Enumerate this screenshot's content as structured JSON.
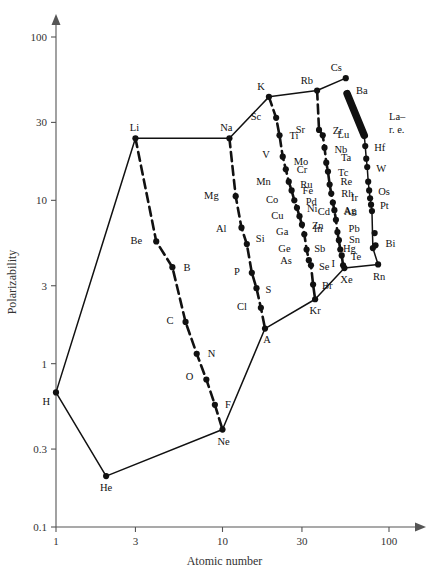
{
  "chart_data": {
    "type": "scatter",
    "title": "",
    "xlabel": "Atomic number",
    "ylabel": "Polarizability",
    "xscale": "log",
    "yscale": "log",
    "xlim": [
      1,
      120
    ],
    "ylim": [
      0.1,
      130
    ],
    "grid": false,
    "legend": null,
    "xticks": [
      "1",
      "3",
      "10",
      "30",
      "100"
    ],
    "xtick_values": [
      1,
      3,
      10,
      30,
      100
    ],
    "yticks": [
      "100",
      "30",
      "10",
      "3",
      "1",
      "0.3",
      "0.1"
    ],
    "ytick_values": [
      100,
      30,
      10,
      3,
      1,
      0.3,
      0.1
    ],
    "annotations": [
      {
        "text": "La–",
        "x": 100,
        "y": 31
      },
      {
        "text": "r. e.",
        "x": 100,
        "y": 26
      }
    ],
    "points": [
      {
        "label": "H",
        "z": 1,
        "v": 0.667,
        "lx": -6,
        "ly": 13
      },
      {
        "label": "He",
        "z": 2,
        "v": 0.205,
        "lx": 0,
        "ly": 15
      },
      {
        "label": "Li",
        "z": 3,
        "v": 24.0,
        "lx": -1,
        "ly": -7
      },
      {
        "label": "Be",
        "z": 4,
        "v": 5.6,
        "lx": -14,
        "ly": 3
      },
      {
        "label": "B",
        "z": 5,
        "v": 3.9,
        "lx": 11,
        "ly": 4
      },
      {
        "label": "C",
        "z": 6,
        "v": 1.8,
        "lx": -12,
        "ly": 2
      },
      {
        "label": "N",
        "z": 7,
        "v": 1.15,
        "lx": 11,
        "ly": 3
      },
      {
        "label": "O",
        "z": 8,
        "v": 0.8,
        "lx": -13,
        "ly": 1
      },
      {
        "label": "F",
        "z": 9,
        "v": 0.56,
        "lx": 10,
        "ly": 3
      },
      {
        "label": "Ne",
        "z": 10,
        "v": 0.395,
        "lx": 1,
        "ly": 15
      },
      {
        "label": "Na",
        "z": 11,
        "v": 24.0,
        "lx": -3,
        "ly": -7
      },
      {
        "label": "Mg",
        "z": 12,
        "v": 10.6,
        "lx": -17,
        "ly": 3
      },
      {
        "label": "Al",
        "z": 13,
        "v": 6.8,
        "lx": -15,
        "ly": 4
      },
      {
        "label": "Si",
        "z": 14,
        "v": 5.4,
        "lx": 9,
        "ly": -2
      },
      {
        "label": "P",
        "z": 15,
        "v": 3.6,
        "lx": -12,
        "ly": 2
      },
      {
        "label": "S",
        "z": 16,
        "v": 2.9,
        "lx": 9,
        "ly": 5
      },
      {
        "label": "Cl",
        "z": 17,
        "v": 2.2,
        "lx": -14,
        "ly": 2
      },
      {
        "label": "A",
        "z": 18,
        "v": 1.64,
        "lx": 2,
        "ly": 14
      },
      {
        "label": "K",
        "z": 19,
        "v": 43.0,
        "lx": -4,
        "ly": -7
      },
      {
        "label": "Sc",
        "z": 21,
        "v": 32.0,
        "lx": -15,
        "ly": 2
      },
      {
        "label": "Ti",
        "z": 22,
        "v": 25.0,
        "lx": 10,
        "ly": 4
      },
      {
        "label": "V",
        "z": 23,
        "v": 18.5,
        "lx": -13,
        "ly": 1
      },
      {
        "label": "Cr",
        "z": 24,
        "v": 15.5,
        "lx": 11,
        "ly": 4
      },
      {
        "label": "Mn",
        "z": 25,
        "v": 13.0,
        "lx": -18,
        "ly": 3
      },
      {
        "label": "Fe",
        "z": 26,
        "v": 11.5,
        "lx": 11,
        "ly": 4
      },
      {
        "label": "Co",
        "z": 27,
        "v": 10.0,
        "lx": -16,
        "ly": 3
      },
      {
        "label": "Ni",
        "z": 28,
        "v": 9.0,
        "lx": 10,
        "ly": 4
      },
      {
        "label": "Cu",
        "z": 29,
        "v": 8.0,
        "lx": -16,
        "ly": 3
      },
      {
        "label": "Zn",
        "z": 30,
        "v": 7.1,
        "lx": 10,
        "ly": 4
      },
      {
        "label": "Ga",
        "z": 31,
        "v": 6.2,
        "lx": -16,
        "ly": 1
      },
      {
        "label": "Ge",
        "z": 32,
        "v": 5.0,
        "lx": -16,
        "ly": 2
      },
      {
        "label": "As",
        "z": 33,
        "v": 4.3,
        "lx": -17,
        "ly": 4
      },
      {
        "label": "Se",
        "z": 34,
        "v": 4.0,
        "lx": 8,
        "ly": 5
      },
      {
        "label": "Br",
        "z": 35,
        "v": 3.05,
        "lx": 9,
        "ly": 4
      },
      {
        "label": "Kr",
        "z": 36,
        "v": 2.48,
        "lx": 0,
        "ly": 15
      },
      {
        "label": "Rb",
        "z": 37,
        "v": 47.0,
        "lx": -4,
        "ly": -7
      },
      {
        "label": "Sr",
        "z": 38,
        "v": 27.0,
        "lx": -14,
        "ly": 3
      },
      {
        "label": "Zr",
        "z": 40,
        "v": 25.0,
        "lx": 10,
        "ly": -1
      },
      {
        "label": "Nb",
        "z": 41,
        "v": 21.0,
        "lx": 10,
        "ly": 5
      },
      {
        "label": "Mo",
        "z": 42,
        "v": 17.0,
        "lx": -18,
        "ly": 2
      },
      {
        "label": "Tc",
        "z": 43,
        "v": 15.0,
        "lx": 10,
        "ly": 4
      },
      {
        "label": "Ru",
        "z": 44,
        "v": 12.5,
        "lx": -17,
        "ly": 3
      },
      {
        "label": "Rh",
        "z": 45,
        "v": 11.0,
        "lx": 10,
        "ly": 3
      },
      {
        "label": "Pd",
        "z": 46,
        "v": 9.7,
        "lx": -16,
        "ly": 3
      },
      {
        "label": "Ag",
        "z": 47,
        "v": 8.7,
        "lx": 9,
        "ly": 4
      },
      {
        "label": "Cd",
        "z": 48,
        "v": 7.6,
        "lx": -6,
        "ly": -5
      },
      {
        "label": "In",
        "z": 49,
        "v": 6.4,
        "lx": -15,
        "ly": 0
      },
      {
        "label": "Sn",
        "z": 50,
        "v": 5.7,
        "lx": 10,
        "ly": 3
      },
      {
        "label": "Sb",
        "z": 51,
        "v": 5.0,
        "lx": -15,
        "ly": 2
      },
      {
        "label": "Te",
        "z": 52,
        "v": 4.6,
        "lx": 9,
        "ly": 5
      },
      {
        "label": "I",
        "z": 53,
        "v": 4.0,
        "lx": -8,
        "ly": 2
      },
      {
        "label": "Xe",
        "z": 54,
        "v": 3.85,
        "lx": 2,
        "ly": 15
      },
      {
        "label": "Cs",
        "z": 55,
        "v": 56.0,
        "lx": -4,
        "ly": -7
      },
      {
        "label": "Ba",
        "z": 56,
        "v": 45.0,
        "lx": 9,
        "ly": 0
      },
      {
        "label": "Lu",
        "z": 71,
        "v": 25.0,
        "lx": -15,
        "ly": 3
      },
      {
        "label": "Hf",
        "z": 72,
        "v": 21.5,
        "lx": 9,
        "ly": 5
      },
      {
        "label": "Ta",
        "z": 73,
        "v": 18.0,
        "lx": -15,
        "ly": 2
      },
      {
        "label": "W",
        "z": 74,
        "v": 16.0,
        "lx": 9,
        "ly": 5
      },
      {
        "label": "Re",
        "z": 75,
        "v": 13.0,
        "lx": -16,
        "ly": 3
      },
      {
        "label": "Os",
        "z": 76,
        "v": 11.5,
        "lx": 9,
        "ly": 5
      },
      {
        "label": "Ir",
        "z": 77,
        "v": 10.3,
        "lx": -12,
        "ly": 3
      },
      {
        "label": "Pt",
        "z": 78,
        "v": 9.4,
        "lx": 9,
        "ly": 4
      },
      {
        "label": "Au",
        "z": 79,
        "v": 8.6,
        "lx": -15,
        "ly": 4
      },
      {
        "label": "Hg",
        "z": 80,
        "v": 5.1,
        "lx": -17,
        "ly": 4
      },
      {
        "label": "Pb",
        "z": 82,
        "v": 6.3,
        "lx": -15,
        "ly": -1
      },
      {
        "label": "Bi",
        "z": 83,
        "v": 5.3,
        "lx": 10,
        "ly": 2
      },
      {
        "label": "Rn",
        "z": 86,
        "v": 4.05,
        "lx": 1,
        "ly": 16
      }
    ],
    "series": [
      {
        "name": "alkali-line",
        "style": "solid",
        "path": [
          "H",
          "Li",
          "Na",
          "K",
          "Rb",
          "Cs"
        ]
      },
      {
        "name": "noble-gas-line",
        "style": "solid",
        "path": [
          "H",
          "He",
          "Ne",
          "A",
          "Kr",
          "Xe",
          "Rn"
        ]
      },
      {
        "name": "period-2-descent",
        "style": "dashed",
        "path": [
          "Li",
          "Be",
          "B",
          "C",
          "N",
          "O",
          "F",
          "Ne"
        ]
      },
      {
        "name": "period-3-descent",
        "style": "dashed",
        "path": [
          "Na",
          "Mg",
          "Al",
          "Si",
          "P",
          "S",
          "Cl",
          "A"
        ]
      },
      {
        "name": "period-4-descent",
        "style": "dashed",
        "path": [
          "K",
          "Sc",
          "Ti",
          "V",
          "Cr",
          "Mn",
          "Fe",
          "Co",
          "Ni",
          "Cu",
          "Zn",
          "Ga",
          "Ge",
          "As",
          "Se",
          "Br",
          "Kr"
        ]
      },
      {
        "name": "period-5-descent",
        "style": "dashed",
        "path": [
          "Rb",
          "Sr",
          "Zr",
          "Nb",
          "Mo",
          "Tc",
          "Ru",
          "Rh",
          "Pd",
          "Ag",
          "Cd",
          "In",
          "Sb",
          "Te",
          "I",
          "Xe"
        ]
      },
      {
        "name": "period-6-descent",
        "style": "solid",
        "path": [
          "Ba",
          "Lu",
          "Hf",
          "Ta",
          "W",
          "Re",
          "Os",
          "Ir",
          "Pt",
          "Au",
          "Hg",
          "Rn"
        ]
      },
      {
        "name": "lanthanide-band",
        "style": "thick",
        "path": [
          "Ba",
          "Lu"
        ]
      }
    ]
  }
}
